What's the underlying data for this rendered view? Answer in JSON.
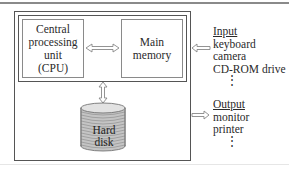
{
  "diagram": {
    "cpu": {
      "lines": [
        "Central",
        "processing",
        "unit",
        "(CPU)"
      ]
    },
    "main_memory": {
      "lines": [
        "Main",
        "memory"
      ]
    },
    "hard_disk": {
      "lines": [
        "Hard",
        "disk"
      ]
    },
    "input": {
      "heading": "Input",
      "items": [
        "keyboard",
        "camera",
        "CD-ROM drive"
      ],
      "more": "⋮"
    },
    "output": {
      "heading": "Output",
      "items": [
        "monitor",
        "printer"
      ],
      "more": "⋮"
    },
    "connections": [
      {
        "from": "cpu",
        "to": "main_memory",
        "type": "bidirectional"
      },
      {
        "from": "main_memory_bus",
        "to": "hard_disk",
        "type": "bidirectional"
      },
      {
        "from": "input",
        "to": "main_memory",
        "type": "unidirectional"
      },
      {
        "from": "system",
        "to": "output",
        "type": "unidirectional"
      }
    ],
    "colors": {
      "border": "#555555",
      "box_border": "#8a8a8a",
      "disk_fill": "#c8c8c8"
    }
  }
}
